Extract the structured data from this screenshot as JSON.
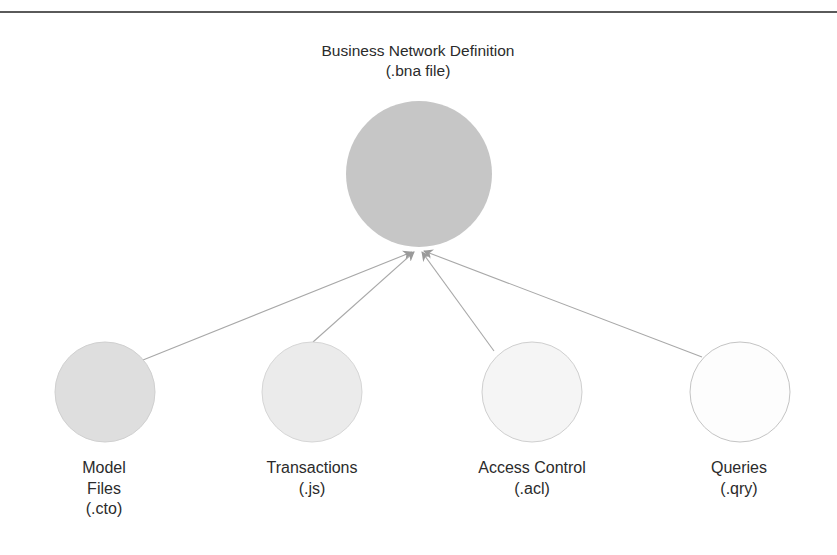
{
  "diagram": {
    "root": {
      "id": "bna",
      "lines": [
        "Business Network Definition",
        "(.bna file)"
      ],
      "cx": 419,
      "cy": 174,
      "r": 73,
      "fill": "#c6c6c6",
      "label_x": 418,
      "label_y": 41
    },
    "children": [
      {
        "id": "model-files",
        "lines": [
          "Model",
          "Files",
          "(.cto)"
        ],
        "cx": 105,
        "cy": 392,
        "r": 50,
        "fill": "#dedede",
        "stroke": "#d0d0d0",
        "label_x": 104,
        "label_y": 458
      },
      {
        "id": "transactions",
        "lines": [
          "Transactions",
          "(.js)"
        ],
        "cx": 312,
        "cy": 392,
        "r": 50,
        "fill": "#ebebeb",
        "stroke": "#d6d6d6",
        "label_x": 312,
        "label_y": 458
      },
      {
        "id": "access-control",
        "lines": [
          "Access Control",
          "(.acl)"
        ],
        "cx": 532,
        "cy": 392,
        "r": 50,
        "fill": "#f5f5f5",
        "stroke": "#cfcfcf",
        "label_x": 532,
        "label_y": 458
      },
      {
        "id": "queries",
        "lines": [
          "Queries",
          "(.qry)"
        ],
        "cx": 740,
        "cy": 392,
        "r": 50,
        "fill": "#fdfdfd",
        "stroke": "#c4c4c4",
        "label_x": 739,
        "label_y": 458
      }
    ],
    "edges": [
      {
        "from": "model-files",
        "to": "bna",
        "x1": 143,
        "y1": 360,
        "x2": 412,
        "y2": 252
      },
      {
        "from": "transactions",
        "to": "bna",
        "x1": 313,
        "y1": 342,
        "x2": 414,
        "y2": 252
      },
      {
        "from": "access-control",
        "to": "bna",
        "x1": 494,
        "y1": 351,
        "x2": 422,
        "y2": 252
      },
      {
        "from": "queries",
        "to": "bna",
        "x1": 702,
        "y1": 357,
        "x2": 424,
        "y2": 251
      }
    ],
    "colors": {
      "edge": "#a8a8a8",
      "arrowhead": "#9a9a9a",
      "rule": "#5a5a5a",
      "text": "#2b2b2b"
    }
  }
}
